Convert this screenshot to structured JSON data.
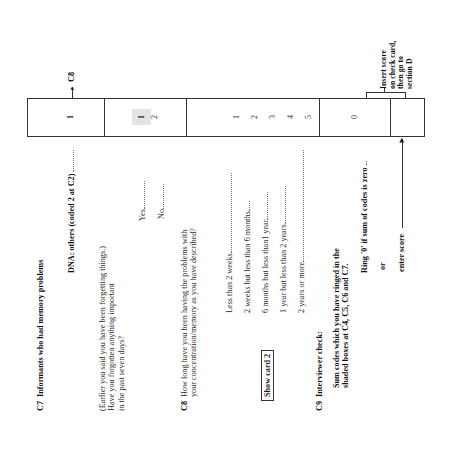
{
  "sections": {
    "c7": {
      "number": "C7",
      "title": "Informants who had memory problems",
      "dna_label": "DNA: others (coded 2 at C2) ",
      "dna_code": "1",
      "dna_route": "C8",
      "question_lines": [
        "(Earlier you said you have been forgetting things.)",
        "Have you forgotten anything important",
        "in the past seven days?"
      ],
      "options": [
        {
          "label": "Yes",
          "code": "1",
          "shaded": true
        },
        {
          "label": "No",
          "code": "2",
          "shaded": false
        }
      ]
    },
    "c8": {
      "number": "C8",
      "question_lines": [
        "How long have you been having the problems with",
        "your concentration/memory as you have described?"
      ],
      "show_card": "Show card 2",
      "options": [
        {
          "label": "Less than 2 weeks",
          "code": "1"
        },
        {
          "label": "2 weeks but less than 6 months",
          "code": "2"
        },
        {
          "label": "6 months but less than1 year",
          "code": "3"
        },
        {
          "label": "1 year but less than 2 years",
          "code": "4"
        },
        {
          "label": "2 years or more",
          "code": "5"
        }
      ]
    },
    "c9": {
      "number": "C9",
      "title": "Interviewer check:",
      "instruction_lines": [
        "Sum codes which you have ringed in the",
        "shaded boxes at C4, C5, C6 and C7."
      ],
      "ring_label": "Ring '0' if sum of codes is zero",
      "ring_code": "0",
      "or_label": "or",
      "enter_label": "enter score",
      "note_lines": [
        "Insert score",
        "on check card,",
        "then go to",
        "section D"
      ]
    }
  }
}
